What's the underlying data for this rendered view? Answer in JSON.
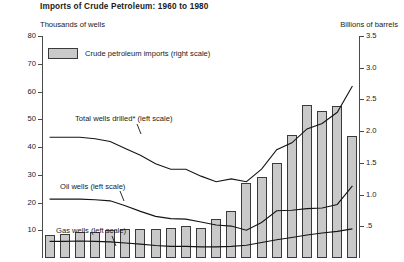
{
  "title": "Imports of Crude Petroleum:  1960 to 1980",
  "axis_left_title": "Thousands of wells",
  "axis_right_title": "Billions of barrels",
  "legend": {
    "swatch_label": "Crude petroleum imports (right scale)"
  },
  "series_labels": {
    "total": "Total wells drilled* (left scale)",
    "oil": "Oil wells (left scale)",
    "gas": "Gas wells (left scale)"
  },
  "left_ticks": [
    "80",
    "70",
    "60",
    "50",
    "40",
    "30",
    "20",
    "10"
  ],
  "right_ticks": [
    "3.5",
    "3.0",
    "2.5",
    "2.0",
    "1.5",
    "1.0",
    ".5"
  ],
  "chart_data": {
    "type": "bar",
    "title": "Imports of Crude Petroleum:  1960 to 1980",
    "xlabel": "",
    "ylabel": "Thousands of wells",
    "y2label": "Billions of barrels",
    "ylim": [
      0,
      80
    ],
    "y2lim": [
      0,
      3.5
    ],
    "grid": false,
    "legend_position": "top-left",
    "categories": [
      "1960",
      "1961",
      "1962",
      "1963",
      "1964",
      "1965",
      "1966",
      "1967",
      "1968",
      "1969",
      "1970",
      "1971",
      "1972",
      "1973",
      "1974",
      "1975",
      "1976",
      "1977",
      "1978",
      "1979",
      "1980"
    ],
    "series": [
      {
        "name": "Crude petroleum imports (right scale)",
        "type": "bar",
        "axis": "right",
        "units": "billions of barrels",
        "values": [
          0.37,
          0.38,
          0.41,
          0.41,
          0.44,
          0.45,
          0.45,
          0.45,
          0.47,
          0.51,
          0.48,
          0.61,
          0.74,
          1.18,
          1.27,
          1.5,
          1.94,
          2.41,
          2.32,
          2.4,
          1.92
        ]
      },
      {
        "name": "Total wells drilled* (left scale)",
        "type": "line",
        "axis": "left",
        "units": "thousands of wells",
        "values": [
          43.5,
          43.5,
          43.5,
          43.0,
          42.0,
          39.5,
          37.0,
          34.0,
          32.0,
          32.0,
          29.5,
          27.5,
          28.5,
          27.5,
          32.0,
          39.0,
          41.5,
          46.5,
          48.5,
          52.5,
          62.0
        ]
      },
      {
        "name": "Oil wells (left scale)",
        "type": "line",
        "axis": "left",
        "units": "thousands of wells",
        "values": [
          21.2,
          21.2,
          21.2,
          21.0,
          20.6,
          18.8,
          16.8,
          15.0,
          14.2,
          14.0,
          13.0,
          11.9,
          11.5,
          10.0,
          12.8,
          17.0,
          17.2,
          17.8,
          18.0,
          19.3,
          26.0
        ]
      },
      {
        "name": "Gas wells (left scale)",
        "type": "line",
        "axis": "left",
        "units": "thousands of wells",
        "values": [
          6.0,
          6.0,
          6.1,
          6.0,
          5.8,
          5.4,
          5.0,
          4.5,
          4.2,
          4.2,
          4.0,
          4.0,
          4.2,
          4.6,
          5.6,
          6.6,
          7.4,
          8.3,
          9.0,
          9.6,
          10.5
        ]
      }
    ]
  }
}
